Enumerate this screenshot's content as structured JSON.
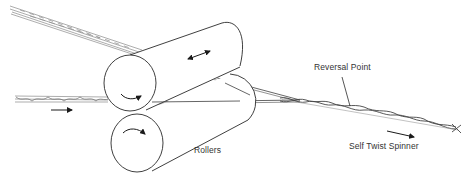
{
  "diagram": {
    "type": "self-twist spinning schematic",
    "labels": {
      "reversal_point": "Reversal Point",
      "rollers": "Rollers",
      "self_twist_spinner": "Self Twist Spinner"
    },
    "components": [
      {
        "id": "top-roller",
        "kind": "cylinder",
        "motion": "rotation + axial oscillation (double-headed arrow)"
      },
      {
        "id": "bottom-roller",
        "kind": "cylinder",
        "motion": "rotation"
      },
      {
        "id": "upper-input-strand",
        "kind": "yarn strand",
        "enters": "between rollers from upper left"
      },
      {
        "id": "lower-input-strand",
        "kind": "yarn strand",
        "enters": "between rollers from left"
      },
      {
        "id": "output-yarn",
        "kind": "self-twisted two-ply yarn",
        "direction": "right"
      }
    ],
    "arrows": [
      {
        "id": "feed-direction-arrow",
        "direction": "right"
      },
      {
        "id": "oscillation-arrow",
        "direction": "bidirectional along roller axis"
      },
      {
        "id": "top-roller-rotation-arrow",
        "direction": "clockwise"
      },
      {
        "id": "bottom-roller-rotation-arrow",
        "direction": "clockwise"
      },
      {
        "id": "output-direction-arrow",
        "direction": "right"
      }
    ],
    "colors": {
      "line": "#2a2a2a",
      "strand": "#777777",
      "background": "#ffffff"
    }
  }
}
